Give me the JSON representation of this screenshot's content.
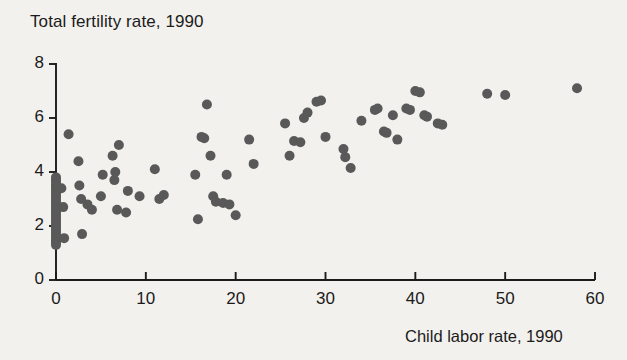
{
  "chart_data": {
    "type": "scatter",
    "title": "Total fertility rate, 1990",
    "ylabel": "Total fertility rate, 1990",
    "xlabel": "Child labor rate, 1990",
    "xlim": [
      0,
      60
    ],
    "ylim": [
      0,
      8
    ],
    "xticks": [
      0,
      10,
      20,
      30,
      40,
      50,
      60
    ],
    "xtick_labels": [
      "0",
      "10",
      "20",
      "30",
      "40",
      "50",
      "60"
    ],
    "yticks": [
      0,
      2,
      4,
      6,
      8
    ],
    "ytick_labels": [
      "0",
      "2",
      "4",
      "6",
      "8"
    ],
    "grid": false,
    "legend": null,
    "marker_color": "#595959",
    "marker_size": 10,
    "background_color": "#f3f1ee",
    "axis_color": "#1b1b1b",
    "points": [
      [
        0.0,
        3.8
      ],
      [
        0.0,
        3.7
      ],
      [
        0.0,
        3.6
      ],
      [
        0.0,
        3.5
      ],
      [
        0.0,
        3.45
      ],
      [
        0.0,
        3.35
      ],
      [
        0.0,
        3.25
      ],
      [
        0.0,
        3.15
      ],
      [
        0.0,
        3.05
      ],
      [
        0.0,
        2.95
      ],
      [
        0.0,
        2.85
      ],
      [
        0.0,
        2.75
      ],
      [
        0.0,
        2.65
      ],
      [
        0.0,
        2.55
      ],
      [
        0.0,
        2.45
      ],
      [
        0.0,
        2.35
      ],
      [
        0.0,
        2.25
      ],
      [
        0.0,
        2.15
      ],
      [
        0.0,
        2.05
      ],
      [
        0.0,
        1.95
      ],
      [
        0.0,
        1.85
      ],
      [
        0.0,
        1.75
      ],
      [
        0.0,
        1.65
      ],
      [
        0.0,
        1.55
      ],
      [
        0.0,
        1.45
      ],
      [
        0.0,
        1.38
      ],
      [
        0.0,
        1.3
      ],
      [
        0.6,
        3.4
      ],
      [
        0.8,
        2.7
      ],
      [
        0.9,
        1.55
      ],
      [
        1.4,
        5.4
      ],
      [
        2.5,
        4.4
      ],
      [
        2.6,
        3.5
      ],
      [
        2.8,
        3.0
      ],
      [
        2.9,
        1.7
      ],
      [
        3.5,
        2.8
      ],
      [
        4.0,
        2.6
      ],
      [
        5.0,
        3.1
      ],
      [
        5.2,
        3.9
      ],
      [
        6.3,
        4.6
      ],
      [
        6.5,
        3.7
      ],
      [
        6.6,
        4.0
      ],
      [
        6.8,
        2.6
      ],
      [
        7.0,
        5.0
      ],
      [
        7.8,
        2.5
      ],
      [
        8.0,
        3.3
      ],
      [
        9.3,
        3.1
      ],
      [
        11.0,
        4.1
      ],
      [
        11.5,
        3.0
      ],
      [
        12.0,
        3.15
      ],
      [
        15.5,
        3.9
      ],
      [
        15.8,
        2.25
      ],
      [
        16.2,
        5.3
      ],
      [
        16.5,
        5.25
      ],
      [
        16.8,
        6.5
      ],
      [
        17.2,
        4.6
      ],
      [
        17.5,
        3.1
      ],
      [
        17.8,
        2.9
      ],
      [
        18.6,
        2.85
      ],
      [
        19.0,
        3.9
      ],
      [
        19.3,
        2.8
      ],
      [
        20.0,
        2.4
      ],
      [
        21.5,
        5.2
      ],
      [
        22.0,
        4.3
      ],
      [
        25.5,
        5.8
      ],
      [
        26.0,
        4.6
      ],
      [
        26.5,
        5.15
      ],
      [
        27.2,
        5.1
      ],
      [
        27.6,
        6.0
      ],
      [
        28.0,
        6.2
      ],
      [
        29.0,
        6.6
      ],
      [
        29.5,
        6.65
      ],
      [
        30.0,
        5.3
      ],
      [
        32.0,
        4.85
      ],
      [
        32.2,
        4.55
      ],
      [
        32.8,
        4.15
      ],
      [
        34.0,
        5.9
      ],
      [
        35.5,
        6.3
      ],
      [
        35.8,
        6.35
      ],
      [
        36.5,
        5.5
      ],
      [
        36.8,
        5.45
      ],
      [
        37.5,
        6.1
      ],
      [
        38.0,
        5.2
      ],
      [
        39.0,
        6.35
      ],
      [
        39.4,
        6.3
      ],
      [
        40.0,
        7.0
      ],
      [
        40.5,
        6.95
      ],
      [
        41.0,
        6.1
      ],
      [
        41.3,
        6.05
      ],
      [
        42.5,
        5.8
      ],
      [
        43.0,
        5.75
      ],
      [
        48.0,
        6.9
      ],
      [
        50.0,
        6.85
      ],
      [
        58.0,
        7.1
      ]
    ]
  }
}
